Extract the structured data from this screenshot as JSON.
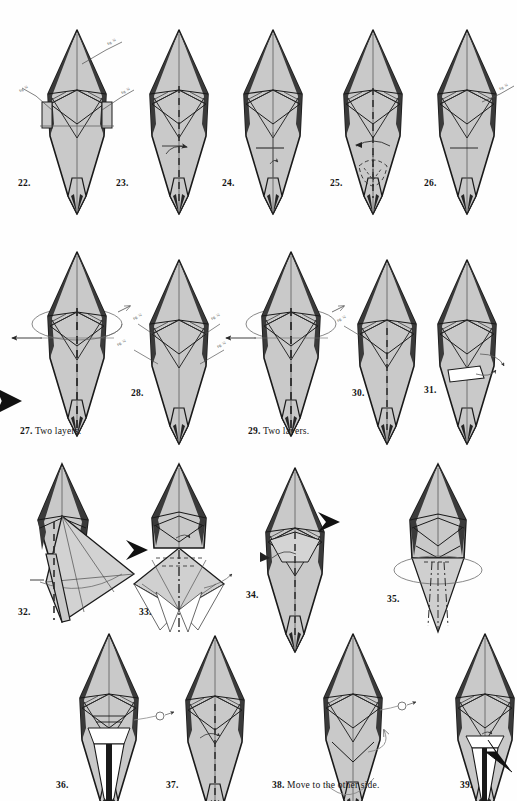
{
  "page": {
    "kind": "origami-instruction-diagram-page",
    "background_color": "#ffffff",
    "paper_fill_color": "#c9c9c9",
    "paper_fill_light": "#f2f2f2",
    "ink_color": "#1a1a1a",
    "width": 517,
    "height": 801,
    "edge_marker": "black-triangle-bleed-marker"
  },
  "rows": [
    {
      "index": 1,
      "steps": [
        "22",
        "23",
        "24",
        "25",
        "26"
      ]
    },
    {
      "index": 2,
      "steps": [
        "27",
        "28",
        "29",
        "30",
        "31"
      ]
    },
    {
      "index": 3,
      "steps": [
        "32",
        "33",
        "34",
        "35"
      ]
    },
    {
      "index": 4,
      "steps": [
        "36",
        "37",
        "38",
        "39"
      ]
    }
  ],
  "steps": [
    {
      "number": "22.",
      "caption": "",
      "x": 18,
      "y": 184,
      "fig_x": 30,
      "fig_y": 28,
      "variant": "kite-callouts"
    },
    {
      "number": "23.",
      "caption": "",
      "x": 116,
      "y": 184,
      "fig_x": 132,
      "fig_y": 28,
      "variant": "kite-valley-arrow"
    },
    {
      "number": "24.",
      "caption": "",
      "x": 222,
      "y": 184,
      "fig_x": 226,
      "fig_y": 28,
      "variant": "kite-plain"
    },
    {
      "number": "25.",
      "caption": "",
      "x": 330,
      "y": 184,
      "fig_x": 326,
      "fig_y": 28,
      "variant": "kite-dashed-lower"
    },
    {
      "number": "26.",
      "caption": "",
      "x": 424,
      "y": 184,
      "fig_x": 420,
      "fig_y": 28,
      "variant": "kite-callout-right"
    },
    {
      "number": "27.",
      "caption": "Two layers.",
      "x": 20,
      "y": 431,
      "fig_x": 30,
      "fig_y": 250,
      "variant": "rotate-ellipse"
    },
    {
      "number": "28.",
      "caption": "",
      "x": 131,
      "y": 393,
      "fig_x": 132,
      "fig_y": 258,
      "variant": "kite-four-callouts"
    },
    {
      "number": "29.",
      "caption": "Two layers.",
      "x": 248,
      "y": 431,
      "fig_x": 244,
      "fig_y": 250,
      "variant": "rotate-ellipse"
    },
    {
      "number": "30.",
      "caption": "",
      "x": 352,
      "y": 393,
      "fig_x": 340,
      "fig_y": 258,
      "variant": "kite-callout-left"
    },
    {
      "number": "31.",
      "caption": "",
      "x": 424,
      "y": 390,
      "fig_x": 420,
      "fig_y": 258,
      "variant": "kite-white-flap"
    },
    {
      "number": "32.",
      "caption": "",
      "x": 18,
      "y": 613,
      "fig_x": 22,
      "fig_y": 462,
      "variant": "big-flap-right"
    },
    {
      "number": "33.",
      "caption": "",
      "x": 139,
      "y": 613,
      "fig_x": 136,
      "fig_y": 462,
      "variant": "pleated-fan"
    },
    {
      "number": "34.",
      "caption": "",
      "x": 246,
      "y": 596,
      "fig_x": 248,
      "fig_y": 466,
      "variant": "kite-black-arrow"
    },
    {
      "number": "35.",
      "caption": "",
      "x": 387,
      "y": 600,
      "fig_x": 394,
      "fig_y": 462,
      "variant": "ellipse-bottom"
    },
    {
      "number": "36.",
      "caption": "",
      "x": 56,
      "y": 786,
      "fig_x": 62,
      "fig_y": 632,
      "variant": "white-tail-magnifier"
    },
    {
      "number": "37.",
      "caption": "",
      "x": 166,
      "y": 786,
      "fig_x": 168,
      "fig_y": 634,
      "variant": "kite-valley-arrow"
    },
    {
      "number": "38.",
      "caption": "Move to the other side.",
      "x": 272,
      "y": 786,
      "fig_x": 306,
      "fig_y": 632,
      "variant": "kite-loop-arrow"
    },
    {
      "number": "39.",
      "caption": "",
      "x": 460,
      "y": 786,
      "fig_x": 438,
      "fig_y": 632,
      "variant": "white-tail-black-arrow"
    }
  ],
  "annotations": {
    "callout_label_text": "fig. 32",
    "legend": {
      "valley_fold": "dashed-line",
      "mountain_fold": "dash-dot-line",
      "push_arrow": "solid-black-arrowhead",
      "rotate": "ellipse-with-arrowheads",
      "repeat": "thin-line-callout"
    }
  }
}
